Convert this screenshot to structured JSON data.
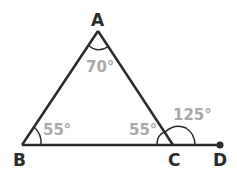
{
  "diagram": {
    "vertices": [
      {
        "name": "A",
        "x": 98,
        "y": 31
      },
      {
        "name": "B",
        "x": 22,
        "y": 145
      },
      {
        "name": "C",
        "x": 173,
        "y": 145
      },
      {
        "name": "D",
        "x": 220,
        "y": 145
      }
    ],
    "angles": {
      "A": "70°",
      "B": "55°",
      "C_interior": "55°",
      "C_exterior": "125°"
    },
    "colors": {
      "line": "#2b2b2b",
      "angle_text": "#a8a8a8"
    }
  }
}
